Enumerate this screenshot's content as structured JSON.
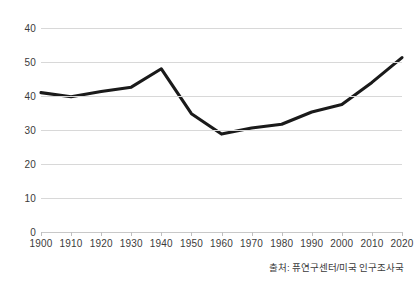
{
  "chart_data": {
    "type": "line",
    "title": "",
    "subtitle": "",
    "xlabel": "",
    "ylabel": "",
    "grid": true,
    "legend": false,
    "legend_position": "none",
    "x": [
      1900,
      1910,
      1920,
      1930,
      1940,
      1950,
      1960,
      1970,
      1980,
      1990,
      2000,
      2010,
      2020
    ],
    "x_tick_labels": [
      "1900",
      "1910",
      "1920",
      "1930",
      "1940",
      "1950",
      "1960",
      "1970",
      "1980",
      "1990",
      "2000",
      "2010",
      "2020"
    ],
    "values": [
      41,
      39.8,
      41.3,
      42.6,
      48,
      34.8,
      28.8,
      30.6,
      31.7,
      35.3,
      37.5,
      44,
      51.3
    ],
    "y_tick_labels": [
      "40",
      "50",
      "40",
      "30",
      "20",
      "10",
      "0"
    ],
    "y_tick_values": [
      60,
      50,
      40,
      30,
      20,
      10,
      0
    ],
    "ylim": [
      0,
      60
    ],
    "xlim": [
      1900,
      2020
    ],
    "series": [
      {
        "name": "",
        "values": [
          41,
          39.8,
          41.3,
          42.6,
          48,
          34.8,
          28.8,
          30.6,
          31.7,
          35.3,
          37.5,
          44,
          51.3
        ]
      }
    ],
    "line_color": "#1a1a1a",
    "grid_color": "#d8d8d8",
    "background_color": "#ffffff"
  },
  "caption": {
    "source_text": "출처: 퓨연구센터/미국 인구조사국"
  }
}
